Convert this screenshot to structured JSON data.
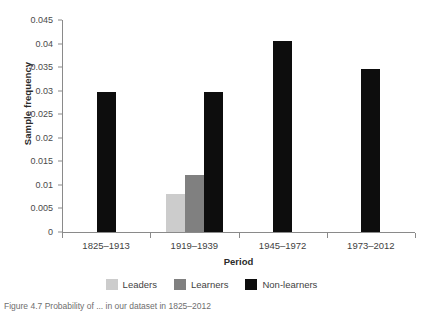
{
  "chart_data": {
    "type": "bar",
    "title": "",
    "xlabel": "Period",
    "ylabel": "Sample frequency",
    "categories": [
      "1825–1913",
      "1919–1939",
      "1945–1972",
      "1973–2012"
    ],
    "series": [
      {
        "name": "Leaders",
        "color": "#cccccc",
        "values": [
          0,
          0.008,
          0,
          0
        ]
      },
      {
        "name": "Learners",
        "color": "#808080",
        "values": [
          0,
          0.012,
          0,
          0
        ]
      },
      {
        "name": "Non-learners",
        "color": "#0d0d0d",
        "values": [
          0.0298,
          0.0298,
          0.0405,
          0.0345
        ]
      }
    ],
    "ylim": [
      0,
      0.045
    ],
    "yticks": [
      0,
      0.005,
      0.01,
      0.015,
      0.02,
      0.025,
      0.03,
      0.035,
      0.04,
      0.045
    ],
    "ytick_labels": [
      "0",
      "0.005",
      "0.01",
      "0.015",
      "0.02",
      "0.025",
      "0.03",
      "0.035",
      "0.04",
      "0.045"
    ],
    "grid": false,
    "legend_position": "bottom"
  },
  "legend": [
    {
      "label": "Leaders",
      "color": "#cccccc"
    },
    {
      "label": "Learners",
      "color": "#808080"
    },
    {
      "label": "Non-learners",
      "color": "#0d0d0d"
    }
  ],
  "caption": "Figure 4.7 Probability of ... in our dataset in 1825–2012"
}
